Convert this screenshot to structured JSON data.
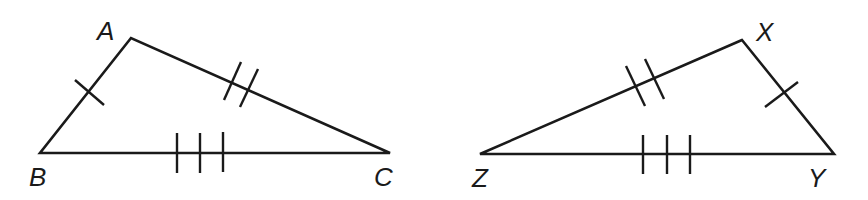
{
  "diagram": {
    "type": "congruent-triangles",
    "triangle1": {
      "vertices": {
        "A": "A",
        "B": "B",
        "C": "C"
      },
      "markings": {
        "AB": 1,
        "AC": 2,
        "BC": 3
      }
    },
    "triangle2": {
      "vertices": {
        "X": "X",
        "Y": "Y",
        "Z": "Z"
      },
      "markings": {
        "XY": 1,
        "XZ": 2,
        "ZY": 3
      }
    },
    "colors": {
      "stroke": "#1a1a1a",
      "background": "#ffffff"
    }
  }
}
